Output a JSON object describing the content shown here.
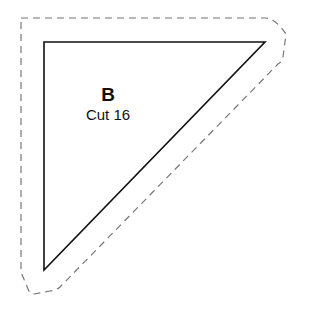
{
  "piece": {
    "letter": "B",
    "instruction": "Cut 16"
  },
  "shapes": {
    "cutting_line": "dashed",
    "sewing_line": "solid",
    "line_color": "#111111",
    "dash_color": "#777777"
  }
}
